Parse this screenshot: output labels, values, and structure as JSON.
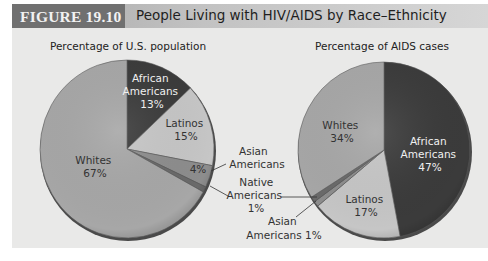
{
  "figure": {
    "number_label": "FIGURE 19.10",
    "title": "People Living with HIV/AIDS by Race–Ethnicity"
  },
  "colors": {
    "panel_bg": "#e9e9e8",
    "dark_slice": "#3b3b3b",
    "whites_slice": "#a7a7a7",
    "latinos_slice": "#c6c6c6",
    "asian_slice": "#8d8d8d",
    "native_slice": "#6a6a6a",
    "rim": "#4a4a4a"
  },
  "chart_data": [
    {
      "type": "pie",
      "title": "Percentage of U.S. population",
      "categories": [
        "African Americans",
        "Latinos",
        "Asian Americans",
        "Native Americans",
        "Whites"
      ],
      "values": [
        13,
        15,
        4,
        1,
        67
      ],
      "labels": {
        "african_americans": [
          "African",
          "Americans",
          "13%"
        ],
        "latinos": [
          "Latinos",
          "15%"
        ],
        "asian_americans_pct": "4%",
        "whites": [
          "Whites",
          "67%"
        ]
      }
    },
    {
      "type": "pie",
      "title": "Percentage of AIDS cases",
      "categories": [
        "African Americans",
        "Latinos",
        "Asian Americans",
        "Native Americans",
        "Whites"
      ],
      "values": [
        47,
        17,
        1,
        1,
        34
      ],
      "labels": {
        "african_americans": [
          "African",
          "Americans",
          "47%"
        ],
        "latinos": [
          "Latinos",
          "17%"
        ],
        "whites": [
          "Whites",
          "34%"
        ]
      }
    }
  ],
  "callouts": {
    "asian_left": [
      "Asian",
      "Americans"
    ],
    "native_shared": [
      "Native",
      "Americans",
      "1%"
    ],
    "asian_right": [
      "Asian",
      "Americans 1%"
    ]
  }
}
